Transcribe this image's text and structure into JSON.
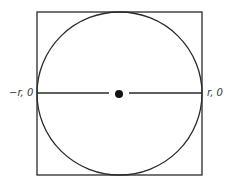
{
  "diagram": {
    "type": "circle inscribed in square with diameter",
    "colors": {
      "stroke": "#2a2a2a",
      "fill_center": "#111111",
      "background": "#ffffff",
      "label": "#333333"
    },
    "square": {
      "x": 37,
      "y": 12,
      "width": 165,
      "height": 163
    },
    "circle": {
      "cx": 119.5,
      "cy": 93.5,
      "rx": 82.5,
      "ry": 81.5
    },
    "diameter_line": {
      "y": 93,
      "left_segment": {
        "x1": 37,
        "x2": 109
      },
      "right_segment": {
        "x1": 129,
        "x2": 202
      }
    },
    "center_point": {
      "cx": 119,
      "cy": 94,
      "r": 4
    },
    "labels": {
      "left": "−r, 0",
      "right": "r, 0"
    }
  }
}
